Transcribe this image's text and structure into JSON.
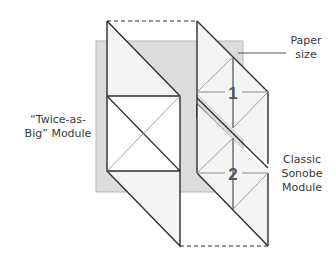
{
  "labels": {
    "twice_as_big_line1": "“Twice-as-",
    "twice_as_big_line2": "Big” Module",
    "paper_size_line1": "Paper",
    "paper_size_line2": "size",
    "classic_line1": "Classic",
    "classic_line2": "Sonobe",
    "classic_line3": "Module"
  },
  "module_numbers": {
    "first": "1",
    "second": "2"
  },
  "colors": {
    "paper_fill": "#dcdcdc",
    "module_fill": "#f4f4f4",
    "stroke": "#2e2e2e",
    "crease": "#8a8a8a",
    "text": "#3a3a3a"
  },
  "geometry": {
    "paper_rect": {
      "x": 96,
      "y": 41,
      "w": 147,
      "h": 151
    },
    "big_module": {
      "left": 107,
      "right": 180,
      "top": 21,
      "square_top": 96,
      "square_bottom": 171,
      "bottom": 246
    },
    "classic_column": {
      "left": 197,
      "right": 268,
      "center": 233
    }
  }
}
